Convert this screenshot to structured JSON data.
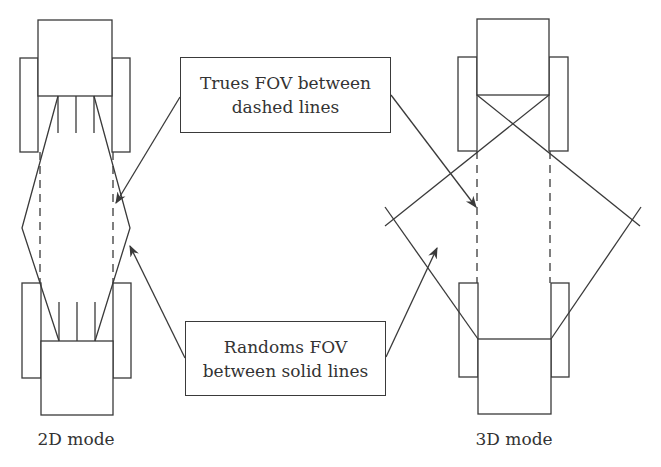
{
  "diagram": {
    "type": "PET scanner acquisition mode comparison",
    "colors": {
      "stroke": "#3a3a3a",
      "text": "#333333",
      "background": "#ffffff"
    },
    "panels": [
      {
        "id": "2d",
        "label": "2D mode",
        "septa": true,
        "septa_count": 3
      },
      {
        "id": "3d",
        "label": "3D mode",
        "septa": false
      }
    ],
    "callouts": {
      "trues": {
        "line1": "Trues FOV between",
        "line2": "dashed lines"
      },
      "randoms": {
        "line1": "Randoms FOV",
        "line2": "between solid lines"
      }
    },
    "legend": {
      "dashed_lines": "Trues FOV",
      "solid_lines": "Randoms FOV"
    }
  }
}
